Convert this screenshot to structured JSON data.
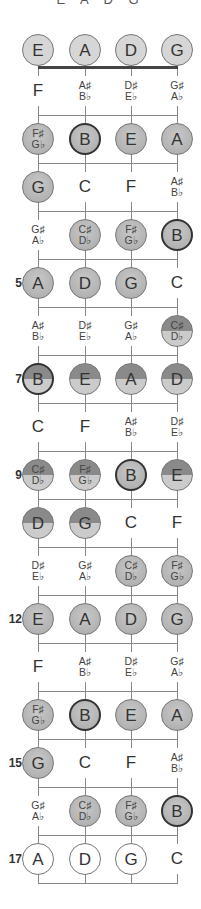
{
  "header": {
    "title": "E A D G"
  },
  "strings": [
    "E",
    "A",
    "D",
    "G"
  ],
  "colors": {
    "light": "#d6d6d6",
    "mid": "#a9a9a9",
    "dark_half": "#8a8a8a",
    "border": "#777777",
    "bold_border": "#333333",
    "line": "#888888",
    "nut": "#444444"
  },
  "fret_labels": {
    "5": "5",
    "7": "7",
    "9": "9",
    "12": "12",
    "15": "15",
    "17": "17"
  },
  "rows": [
    {
      "fret": 0,
      "notes": [
        {
          "t": "E",
          "s": "light"
        },
        {
          "t": "A",
          "s": "light"
        },
        {
          "t": "D",
          "s": "light"
        },
        {
          "t": "G",
          "s": "light"
        }
      ]
    },
    {
      "fret": 1,
      "notes": [
        {
          "t": "F",
          "s": "plain"
        },
        {
          "t": "A♯",
          "b": "B♭",
          "s": "plain"
        },
        {
          "t": "D♯",
          "b": "E♭",
          "s": "plain"
        },
        {
          "t": "G♯",
          "b": "A♭",
          "s": "plain"
        }
      ]
    },
    {
      "fret": 2,
      "notes": [
        {
          "t": "F♯",
          "b": "G♭",
          "s": "mid"
        },
        {
          "t": "B",
          "s": "mid bold"
        },
        {
          "t": "E",
          "s": "mid"
        },
        {
          "t": "A",
          "s": "mid"
        }
      ]
    },
    {
      "fret": 3,
      "notes": [
        {
          "t": "G",
          "s": "mid"
        },
        {
          "t": "C",
          "s": "plain"
        },
        {
          "t": "F",
          "s": "plain"
        },
        {
          "t": "A♯",
          "b": "B♭",
          "s": "plain"
        }
      ]
    },
    {
      "fret": 4,
      "notes": [
        {
          "t": "G♯",
          "b": "A♭",
          "s": "plain"
        },
        {
          "t": "C♯",
          "b": "D♭",
          "s": "mid"
        },
        {
          "t": "F♯",
          "b": "G♭",
          "s": "mid"
        },
        {
          "t": "B",
          "s": "mid bold"
        }
      ]
    },
    {
      "fret": 5,
      "notes": [
        {
          "t": "A",
          "s": "mid"
        },
        {
          "t": "D",
          "s": "mid"
        },
        {
          "t": "G",
          "s": "mid"
        },
        {
          "t": "C",
          "s": "plain"
        }
      ]
    },
    {
      "fret": 6,
      "notes": [
        {
          "t": "A♯",
          "b": "B♭",
          "s": "plain"
        },
        {
          "t": "D♯",
          "b": "E♭",
          "s": "plain"
        },
        {
          "t": "G♯",
          "b": "A♭",
          "s": "plain"
        },
        {
          "t": "C♯",
          "b": "D♭",
          "s": "half"
        }
      ]
    },
    {
      "fret": 7,
      "notes": [
        {
          "t": "B",
          "s": "half bold"
        },
        {
          "t": "E",
          "s": "half"
        },
        {
          "t": "A",
          "s": "half"
        },
        {
          "t": "D",
          "s": "half"
        }
      ]
    },
    {
      "fret": 8,
      "notes": [
        {
          "t": "C",
          "s": "plain"
        },
        {
          "t": "F",
          "s": "plain"
        },
        {
          "t": "A♯",
          "b": "B♭",
          "s": "plain"
        },
        {
          "t": "D♯",
          "b": "E♭",
          "s": "plain"
        }
      ]
    },
    {
      "fret": 9,
      "notes": [
        {
          "t": "C♯",
          "b": "D♭",
          "s": "half"
        },
        {
          "t": "F♯",
          "b": "G♭",
          "s": "half"
        },
        {
          "t": "B",
          "s": "mid bold"
        },
        {
          "t": "E",
          "s": "half"
        }
      ]
    },
    {
      "fret": 10,
      "notes": [
        {
          "t": "D",
          "s": "half"
        },
        {
          "t": "G",
          "s": "half"
        },
        {
          "t": "C",
          "s": "plain"
        },
        {
          "t": "F",
          "s": "plain"
        }
      ]
    },
    {
      "fret": 11,
      "notes": [
        {
          "t": "D♯",
          "b": "E♭",
          "s": "plain"
        },
        {
          "t": "G♯",
          "b": "A♭",
          "s": "plain"
        },
        {
          "t": "C♯",
          "b": "D♭",
          "s": "mid"
        },
        {
          "t": "F♯",
          "b": "G♭",
          "s": "mid"
        }
      ]
    },
    {
      "fret": 12,
      "notes": [
        {
          "t": "E",
          "s": "mid"
        },
        {
          "t": "A",
          "s": "mid"
        },
        {
          "t": "D",
          "s": "mid"
        },
        {
          "t": "G",
          "s": "mid"
        }
      ]
    },
    {
      "fret": 13,
      "notes": [
        {
          "t": "F",
          "s": "plain"
        },
        {
          "t": "A♯",
          "b": "B♭",
          "s": "plain"
        },
        {
          "t": "D♯",
          "b": "E♭",
          "s": "plain"
        },
        {
          "t": "G♯",
          "b": "A♭",
          "s": "plain"
        }
      ]
    },
    {
      "fret": 14,
      "notes": [
        {
          "t": "F♯",
          "b": "G♭",
          "s": "mid"
        },
        {
          "t": "B",
          "s": "mid bold"
        },
        {
          "t": "E",
          "s": "mid"
        },
        {
          "t": "A",
          "s": "mid"
        }
      ]
    },
    {
      "fret": 15,
      "notes": [
        {
          "t": "G",
          "s": "mid"
        },
        {
          "t": "C",
          "s": "plain"
        },
        {
          "t": "F",
          "s": "plain"
        },
        {
          "t": "A♯",
          "b": "B♭",
          "s": "plain"
        }
      ]
    },
    {
      "fret": 16,
      "notes": [
        {
          "t": "G♯",
          "b": "A♭",
          "s": "plain"
        },
        {
          "t": "C♯",
          "b": "D♭",
          "s": "mid"
        },
        {
          "t": "F♯",
          "b": "G♭",
          "s": "mid"
        },
        {
          "t": "B",
          "s": "mid bold"
        }
      ]
    },
    {
      "fret": 17,
      "notes": [
        {
          "t": "A",
          "s": "white"
        },
        {
          "t": "D",
          "s": "white"
        },
        {
          "t": "G",
          "s": "white"
        },
        {
          "t": "C",
          "s": "plain"
        }
      ]
    }
  ]
}
